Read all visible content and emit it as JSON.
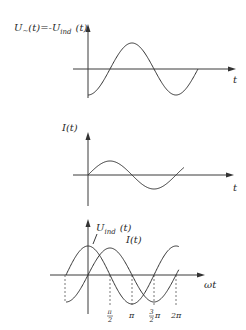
{
  "chart_data": [
    {
      "type": "line",
      "title": "",
      "ylabel": "U~(t) = -U_ind(t)",
      "xlabel": "t",
      "series": [
        {
          "name": "U~(t)",
          "function": "-cos(wt)",
          "x_range_rad": [
            0,
            7.85
          ]
        }
      ],
      "grid": false
    },
    {
      "type": "line",
      "title": "",
      "ylabel": "I(t)",
      "xlabel": "t",
      "series": [
        {
          "name": "I(t)",
          "function": "sin(wt)",
          "amplitude_ratio": 0.5,
          "x_range_rad": [
            0,
            6.85
          ]
        }
      ],
      "grid": false
    },
    {
      "type": "line",
      "title": "",
      "ylabel": "",
      "xlabel": "ωt",
      "series": [
        {
          "name": "U_ind(t)",
          "function": "cos(wt)",
          "x_range_rad": [
            -1.5708,
            6.5
          ]
        },
        {
          "name": "I(t)",
          "function": "sin(wt)",
          "x_range_rad": [
            -1.5708,
            6.5
          ]
        }
      ],
      "x_ticks": [
        "π/2",
        "π",
        "3/2 π",
        "2π"
      ],
      "x_tick_values": [
        1.5708,
        3.1416,
        4.7124,
        6.2832
      ],
      "grid": false
    }
  ],
  "graph1": {
    "label_main": "U",
    "label_sub1": "~",
    "label_mid": "(t)=-U",
    "label_sub2": "ind",
    "label_end": "(t)",
    "xlabel": "t"
  },
  "graph2": {
    "ylabel": "I(t)",
    "xlabel": "t"
  },
  "graph3": {
    "u_label_main": "U",
    "u_label_sub": "ind",
    "u_label_end": "(t)",
    "i_label": "I(t)",
    "xlabel": "ωt",
    "ticks": {
      "pi_half_num": "π",
      "pi_half_den": "2",
      "pi": "π",
      "three_half_num": "3",
      "three_half_den": "2",
      "three_half_pi": "π",
      "two_pi": "2π"
    }
  }
}
